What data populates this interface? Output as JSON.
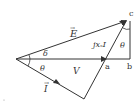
{
  "diagram": {
    "type": "phasor-diagram",
    "vectors": [
      {
        "name": "E",
        "label": "E⃗",
        "from": "origin",
        "to": "c"
      },
      {
        "name": "V",
        "label": "V",
        "from": "origin",
        "to": "a"
      },
      {
        "name": "I",
        "label": "I⃗",
        "from": "origin",
        "to": "I-tip"
      },
      {
        "name": "jxsI",
        "label": "jxₛI",
        "from": "a",
        "to": "c"
      }
    ],
    "angles": {
      "delta": "δ",
      "theta_bottom": "θ",
      "theta_top": "θ"
    },
    "points": {
      "a": "a",
      "b": "b",
      "c": "c"
    },
    "labels": {
      "E": "E",
      "E_arrow": "→",
      "V": "V",
      "I": "I",
      "I_arrow": "→",
      "jxsI": "jxₛI",
      "delta": "δ",
      "theta1": "θ",
      "theta2": "θ",
      "a": "a",
      "b": "b",
      "c": "c"
    }
  }
}
